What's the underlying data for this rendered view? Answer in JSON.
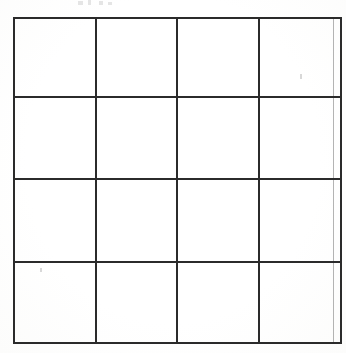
{
  "page": {
    "background_color": "#fefefe",
    "width": 346,
    "height": 353
  },
  "grid": {
    "name": "blank-4x4-grid",
    "rows": 4,
    "columns": 4,
    "line_color": "#2b2b2b",
    "line_width_px": 2,
    "outer_left_px": 13,
    "outer_top_px": 17,
    "outer_width_px": 319,
    "outer_height_px": 325,
    "column_widths_px": [
      80,
      79,
      80,
      80
    ],
    "row_heights_px": [
      79,
      82,
      83,
      81
    ],
    "vertical_line_positions_px": [
      13,
      93,
      172,
      252,
      332
    ],
    "horizontal_line_positions_px": [
      17,
      96,
      178,
      261,
      342
    ],
    "cells": [
      [
        "",
        "",
        "",
        ""
      ],
      [
        "",
        "",
        "",
        ""
      ],
      [
        "",
        "",
        "",
        ""
      ],
      [
        "",
        "",
        "",
        ""
      ]
    ]
  },
  "artifacts": {
    "top_edge_marks": [
      {
        "left": 78,
        "top": 1,
        "width": 5,
        "height": 4
      },
      {
        "left": 88,
        "top": 0,
        "width": 3,
        "height": 5
      },
      {
        "left": 99,
        "top": 1,
        "width": 4,
        "height": 4
      },
      {
        "left": 108,
        "top": 2,
        "width": 4,
        "height": 3
      }
    ],
    "specks": [
      {
        "left": 300,
        "top": 74,
        "width": 2,
        "height": 5
      },
      {
        "left": 40,
        "top": 268,
        "width": 2,
        "height": 4
      }
    ]
  }
}
